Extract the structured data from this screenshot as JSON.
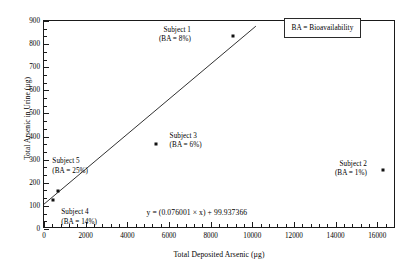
{
  "chart_data": {
    "type": "scatter",
    "title": "",
    "xlabel": "Total Deposited Arsenic (µg)",
    "ylabel": "Total Arsenic in Urine (µg)",
    "xlim": [
      0,
      16900
    ],
    "ylim": [
      0,
      900
    ],
    "x_ticks": [
      0,
      2000,
      4000,
      6000,
      8000,
      10000,
      12000,
      14000,
      16000
    ],
    "x_tick_labels": [
      "0",
      "2000",
      "4000",
      "6000",
      "8000",
      "10000",
      "12000",
      "14000",
      "16000"
    ],
    "y_ticks": [
      0,
      100,
      200,
      300,
      400,
      500,
      600,
      700,
      800,
      900
    ],
    "y_tick_labels": [
      "0",
      "100",
      "200",
      "300",
      "400",
      "500",
      "600",
      "700",
      "800",
      "900"
    ],
    "x_minor_ticks_per_interval": 4,
    "y_minor_ticks_per_interval": 2,
    "grid": false,
    "legend_position": "top-right",
    "marker_color": "#111111",
    "line_color": "#1a1a1a",
    "frame_color": "#1a1a1a",
    "points": [
      {
        "label": "Subject 1",
        "ba_label": "(BA = 8%)",
        "ba_percent": 8,
        "x": 9070,
        "y": 835
      },
      {
        "label": "Subject 2",
        "ba_label": "(BA = 1%)",
        "ba_percent": 1,
        "x": 16280,
        "y": 255
      },
      {
        "label": "Subject 3",
        "ba_label": "(BA = 6%)",
        "ba_percent": 6,
        "x": 5380,
        "y": 368
      },
      {
        "label": "Subject 4",
        "ba_label": "(BA = 14%)",
        "ba_percent": 14,
        "x": 430,
        "y": 125
      },
      {
        "label": "Subject 5",
        "ba_label": "(BA = 25%)",
        "ba_percent": 25,
        "x": 672,
        "y": 164
      }
    ],
    "annotations": [
      {
        "name": "subject-1",
        "line1": "Subject 1",
        "line2": "(BA = 8%)",
        "x": 7150,
        "y": 880,
        "align": "right"
      },
      {
        "name": "subject-2",
        "line1": "Subject 2",
        "line2": "(BA = 1%)",
        "x": 15600,
        "y": 300,
        "align": "right"
      },
      {
        "name": "subject-3",
        "line1": "Subject 3",
        "line2": "(BA = 6%)",
        "x": 6030,
        "y": 420,
        "align": "left"
      },
      {
        "name": "subject-4",
        "line1": "Subject 4",
        "line2": "(BA = 14%)",
        "x": 830,
        "y": 90,
        "align": "left"
      },
      {
        "name": "subject-5",
        "line1": "Subject 5",
        "line2": "(BA = 25%)",
        "x": 400,
        "y": 310,
        "align": "left"
      }
    ],
    "regression": {
      "slope": 0.076001,
      "intercept": 99.937366,
      "equation_text": "y =  (0.076001 × x) + 99.937366",
      "x_start": 0,
      "x_end": 10230
    },
    "legend": {
      "text": "BA = Bioavailability",
      "x": 11500,
      "y": 885
    },
    "equation_position": {
      "x": 9850,
      "y": 90
    }
  }
}
